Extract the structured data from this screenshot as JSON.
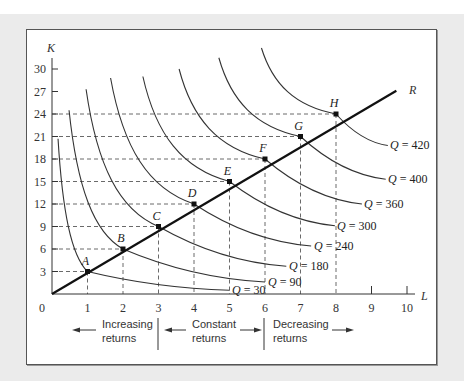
{
  "chart_data": {
    "type": "line",
    "title": "",
    "xlabel": "L",
    "ylabel": "K",
    "xlim": [
      0,
      10
    ],
    "ylim": [
      0,
      30
    ],
    "x_ticks": [
      "1",
      "2",
      "3",
      "4",
      "5",
      "6",
      "7",
      "8",
      "9",
      "10"
    ],
    "y_ticks": [
      "3",
      "6",
      "9",
      "12",
      "15",
      "18",
      "21",
      "24",
      "27",
      "30"
    ],
    "origin_label": "0",
    "grid": false,
    "expansion_path": {
      "name": "R",
      "from": [
        0,
        0
      ],
      "to": [
        9.7,
        27.1
      ],
      "points": [
        {
          "label": "A",
          "L": 1,
          "K": 3
        },
        {
          "label": "B",
          "L": 2,
          "K": 6
        },
        {
          "label": "C",
          "L": 3,
          "K": 9
        },
        {
          "label": "D",
          "L": 4,
          "K": 12
        },
        {
          "label": "E",
          "L": 5,
          "K": 15
        },
        {
          "label": "F",
          "L": 6,
          "K": 18
        },
        {
          "label": "G",
          "L": 7,
          "K": 21
        },
        {
          "label": "H",
          "L": 8,
          "K": 24
        }
      ]
    },
    "isoquants": [
      {
        "name": "Q = 30",
        "label": "Q = 30",
        "through": "A",
        "start": [
          0.17,
          20.7
        ],
        "end": [
          5.0,
          0.5
        ]
      },
      {
        "name": "Q = 90",
        "label": "Q = 90",
        "through": "B",
        "start": [
          0.48,
          24.5
        ],
        "end": [
          6.0,
          1.6
        ]
      },
      {
        "name": "Q = 180",
        "label": "Q = 180",
        "through": "C",
        "start": [
          0.96,
          27.3
        ],
        "end": [
          6.6,
          3.7
        ]
      },
      {
        "name": "Q = 240",
        "label": "Q = 240",
        "through": "D",
        "start": [
          1.65,
          28.8
        ],
        "end": [
          7.3,
          6.4
        ]
      },
      {
        "name": "Q = 300",
        "label": "Q = 300",
        "through": "E",
        "start": [
          2.56,
          29.0
        ],
        "end": [
          7.97,
          9.1
        ]
      },
      {
        "name": "Q = 360",
        "label": "Q = 360",
        "through": "F",
        "start": [
          3.58,
          30.0
        ],
        "end": [
          8.73,
          12.0
        ]
      },
      {
        "name": "Q = 400",
        "label": "Q = 400",
        "through": "G",
        "start": [
          4.7,
          31.5
        ],
        "end": [
          9.4,
          15.3
        ]
      },
      {
        "name": "Q = 420",
        "label": "Q = 420",
        "through": "H",
        "start": [
          5.9,
          32.8
        ],
        "end": [
          9.46,
          19.8
        ]
      }
    ],
    "annotations": [
      {
        "text": "Increasing returns",
        "arrow": "left",
        "range_L": [
          0,
          3
        ]
      },
      {
        "text": "Constant returns",
        "arrow": "both",
        "range_L": [
          3,
          6
        ]
      },
      {
        "text": "Decreasing returns",
        "arrow": "right",
        "range_L": [
          6,
          10
        ]
      }
    ],
    "legend": "none"
  },
  "regions": {
    "increasing": {
      "line1": "Increasing",
      "line2": "returns"
    },
    "constant": {
      "line1": "Constant",
      "line2": "returns"
    },
    "decreasing": {
      "line1": "Decreasing",
      "line2": "returns"
    }
  },
  "axis": {
    "x_title": "L",
    "y_title": "K",
    "origin": "0",
    "ray_label": "R"
  }
}
